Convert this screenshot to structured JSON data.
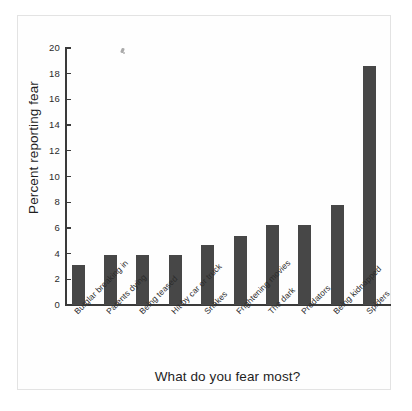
{
  "chart_data": {
    "type": "bar",
    "title": "",
    "xlabel": "What do you fear most?",
    "ylabel": "Percent reporting fear",
    "ylim": [
      0,
      20
    ],
    "ytick_values": [
      0,
      2,
      4,
      6,
      8,
      10,
      12,
      14,
      16,
      18,
      20
    ],
    "ytick_labels": [
      "0",
      "2",
      "4",
      "6",
      "8",
      "10",
      "12",
      "14",
      "16",
      "18",
      "20"
    ],
    "grid": false,
    "legend": null,
    "categories": [
      "Burglar breaking in",
      "Parents dying",
      "Being teased",
      "Hit by car or truck",
      "Snakes",
      "Frightening movies",
      "The dark",
      "Predators",
      "Being kidnapped",
      "Spiders"
    ],
    "values": [
      3.1,
      3.9,
      3.9,
      3.9,
      4.7,
      5.4,
      6.2,
      6.2,
      7.8,
      18.6
    ],
    "bar_color": "#474747",
    "axis_color": "#3a3a3a",
    "background": "#ffffff"
  }
}
